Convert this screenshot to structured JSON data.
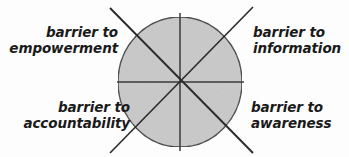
{
  "diagram": {
    "type": "pie-segmented-circle",
    "title": "",
    "canvas": {
      "width": 349,
      "height": 157
    },
    "background_color": "#fdfdfd",
    "circle": {
      "name": "barriers-circle",
      "center_x": 180,
      "center_y": 82,
      "radius_x": 62,
      "radius_y": 65,
      "fill_color": "#c9c9c9",
      "stroke_color": "#3a3a3a",
      "stroke_width": 1.4
    },
    "divider_lines": [
      {
        "name": "vertical-divider",
        "angle_deg": 90,
        "stroke_color": "#3a3a3a"
      },
      {
        "name": "horizontal-divider",
        "angle_deg": 0,
        "stroke_color": "#3a3a3a"
      },
      {
        "name": "diagonal-divider-nw-se",
        "angle_deg": 135,
        "stroke_color": "#2b2b2b"
      },
      {
        "name": "diagonal-divider-ne-sw",
        "angle_deg": 45,
        "stroke_color": "#2b2b2b"
      }
    ],
    "labels": [
      {
        "id": "empowerment",
        "quadrant": "top-left",
        "align": "right",
        "line1": "barrier to",
        "line2": "empowerment"
      },
      {
        "id": "information",
        "quadrant": "top-right",
        "align": "left",
        "line1": "barrier to",
        "line2": "information"
      },
      {
        "id": "accountability",
        "quadrant": "bottom-left",
        "align": "right",
        "line1": "barrier to",
        "line2": "accountability"
      },
      {
        "id": "awareness",
        "quadrant": "bottom-right",
        "align": "left",
        "line1": "barrier to",
        "line2": "awareness"
      }
    ]
  },
  "colors": {
    "text": "#1a1a1a",
    "circle_fill": "#c9c9c9",
    "circle_stroke": "#3a3a3a",
    "line": "#2b2b2b",
    "background": "#fdfdfd"
  }
}
